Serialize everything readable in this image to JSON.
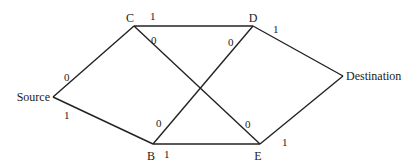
{
  "diagram": {
    "type": "network-graph",
    "nodes": [
      {
        "id": "source",
        "label": "Source",
        "x": 53,
        "y": 97
      },
      {
        "id": "C",
        "label": "C",
        "x": 134,
        "y": 26
      },
      {
        "id": "D",
        "label": "D",
        "x": 253,
        "y": 26
      },
      {
        "id": "B",
        "label": "B",
        "x": 153,
        "y": 144
      },
      {
        "id": "E",
        "label": "E",
        "x": 260,
        "y": 144
      },
      {
        "id": "destination",
        "label": "Destination",
        "x": 343,
        "y": 76
      }
    ],
    "edges": [
      {
        "from": "source",
        "to": "C",
        "weight": "0"
      },
      {
        "from": "source",
        "to": "B",
        "weight": "1"
      },
      {
        "from": "C",
        "to": "D",
        "weight": "1"
      },
      {
        "from": "C",
        "to": "E",
        "weight_near_C": "0",
        "weight_near_E": "0"
      },
      {
        "from": "B",
        "to": "D",
        "weight_near_B": "0",
        "weight_near_D": "0"
      },
      {
        "from": "B",
        "to": "E",
        "weight": "1"
      },
      {
        "from": "D",
        "to": "destination",
        "weight": "1"
      },
      {
        "from": "E",
        "to": "destination",
        "weight": "1"
      }
    ],
    "labels": {
      "source": "Source",
      "destination": "Destination",
      "C": "C",
      "D": "D",
      "B": "B",
      "E": "E"
    },
    "weights": {
      "source_c": "0",
      "source_b": "1",
      "c_d": "1",
      "c_e_near_c": "0",
      "c_e_near_e": "0",
      "b_d_near_b": "0",
      "b_d_near_d": "0",
      "b_e": "1",
      "d_dest": "1",
      "e_dest": "1"
    },
    "colors": {
      "line": "#222222",
      "background": "#ffffff"
    }
  }
}
